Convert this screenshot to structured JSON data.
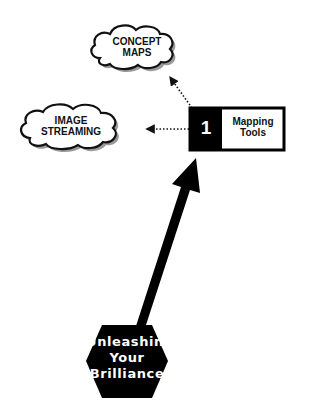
{
  "diagram": {
    "central_node": {
      "label_lines": [
        "Unleashing",
        "Your",
        "Brilliance"
      ],
      "shape": "hexagon",
      "fill": "#000000",
      "text_color": "#ffffff"
    },
    "main_arrow": {
      "from": "central_node",
      "to": "tool_box",
      "style": "thick-solid",
      "color": "#000000"
    },
    "tool_box": {
      "number": "1",
      "label_lines": [
        "Mapping",
        "Tools"
      ],
      "number_bg": "#000000",
      "label_bg": "#ffffff"
    },
    "branches": [
      {
        "label_lines": [
          "CONCEPT",
          "MAPS"
        ],
        "shape": "cloud",
        "connector": "dotted-arrow"
      },
      {
        "label_lines": [
          "IMAGE",
          "STREAMING"
        ],
        "shape": "cloud",
        "connector": "dotted-arrow"
      }
    ]
  }
}
